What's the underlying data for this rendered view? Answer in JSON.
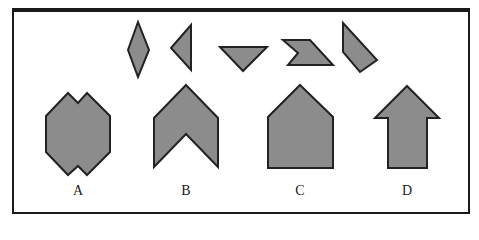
{
  "figure": {
    "fill_color": "#8c8c8c",
    "stroke_color": "#222222",
    "border_color": "#1a1a1a"
  },
  "pieces": [
    {
      "name": "diamond",
      "points": "138,22 149,50 138,77 128,50"
    },
    {
      "name": "left-triangle",
      "points": "191,25 191,70 171,48"
    },
    {
      "name": "down-triangle",
      "points": "220,47 267,47 243,71"
    },
    {
      "name": "notched-parallelogram",
      "points": "283,40 310,40 333,65 288,65 298,53"
    },
    {
      "name": "slanted-quadrilateral",
      "points": "343,23 377,60 360,72 343,52"
    }
  ],
  "options": [
    {
      "label": "A",
      "x": 78,
      "points": "46,116 68,93 78,103 87,93 110,116 110,152 87,175 78,166 68,175 46,152"
    },
    {
      "label": "B",
      "x": 186,
      "points": "186,85 218,118 218,167 186,134 154,167 154,118"
    },
    {
      "label": "C",
      "x": 300,
      "points": "300,85 333,117 333,168 268,168 268,117"
    },
    {
      "label": "D",
      "x": 407,
      "points": "407,86 439,118 427,118 427,168 388,168 388,118 375,118"
    }
  ]
}
